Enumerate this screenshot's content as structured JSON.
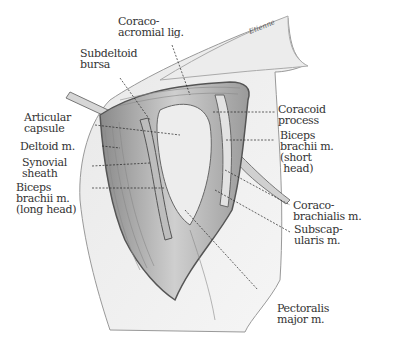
{
  "figure": {
    "signature": "Etienne",
    "labels": [
      {
        "id": "coraco-acromial-lig",
        "lines": [
          "Coraco-",
          "acromial lig."
        ]
      },
      {
        "id": "subdeltoid-bursa",
        "lines": [
          "Subdeltoid",
          "bursa"
        ]
      },
      {
        "id": "articular-capsule",
        "lines": [
          "Articular",
          "capsule"
        ]
      },
      {
        "id": "deltoid-m",
        "lines": [
          "Deltoid m."
        ]
      },
      {
        "id": "synovial-sheath",
        "lines": [
          "Synovial",
          "sheath"
        ]
      },
      {
        "id": "biceps-long-head",
        "lines": [
          "Biceps",
          "brachii m.",
          "(long head)"
        ]
      },
      {
        "id": "coracoid-process",
        "lines": [
          "Coracoid",
          "process"
        ]
      },
      {
        "id": "biceps-short-head",
        "lines": [
          "Biceps",
          "brachii m.",
          "(short",
          " head)"
        ]
      },
      {
        "id": "coracobrachialis",
        "lines": [
          "Coraco-",
          "brachialis m."
        ]
      },
      {
        "id": "subscapularis",
        "lines": [
          "Subscap-",
          "ularis m."
        ]
      },
      {
        "id": "pectoralis-major",
        "lines": [
          "Pectoralis",
          "major m."
        ]
      }
    ]
  }
}
